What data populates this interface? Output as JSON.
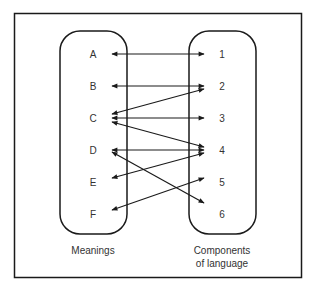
{
  "meanings": {
    "caption": "Meanings",
    "items": [
      "A",
      "B",
      "C",
      "D",
      "E",
      "F"
    ]
  },
  "components": {
    "caption_line1": "Components",
    "caption_line2": "of language",
    "items": [
      "1",
      "2",
      "3",
      "4",
      "5",
      "6"
    ]
  },
  "connections": [
    {
      "from": "A",
      "to": "1",
      "bidirectional": true
    },
    {
      "from": "B",
      "to": "2",
      "bidirectional": true
    },
    {
      "from": "C",
      "to": "2",
      "bidirectional": true
    },
    {
      "from": "C",
      "to": "3",
      "bidirectional": true
    },
    {
      "from": "C",
      "to": "4",
      "bidirectional": true
    },
    {
      "from": "D",
      "to": "4",
      "bidirectional": true
    },
    {
      "from": "D",
      "to": "6",
      "bidirectional": true
    },
    {
      "from": "E",
      "to": "4",
      "bidirectional": true
    },
    {
      "from": "F",
      "to": "5",
      "bidirectional": true
    }
  ],
  "colors": {
    "stroke": "#1a1a1a",
    "text": "#333333",
    "background": "#ffffff"
  }
}
